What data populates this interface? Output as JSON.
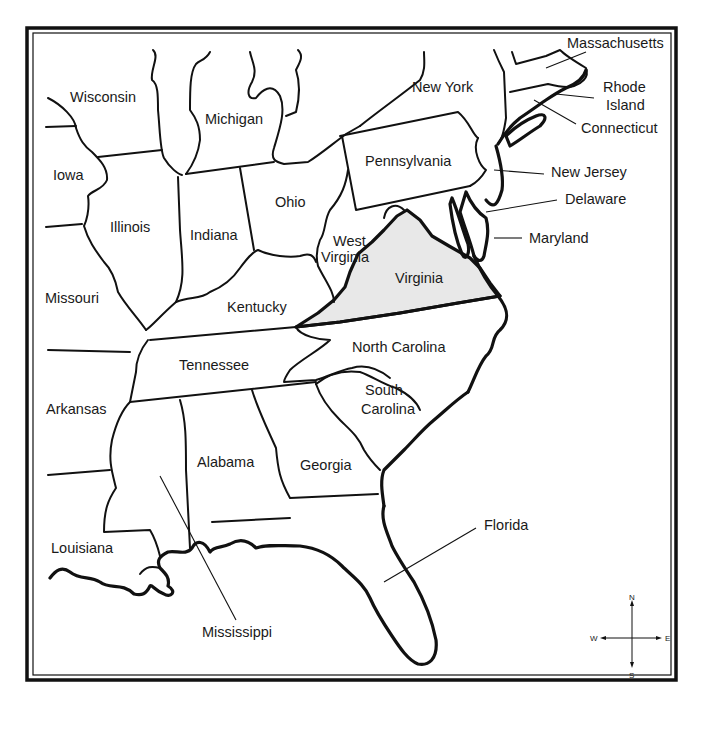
{
  "map": {
    "title": "",
    "highlighted_state": "Virginia",
    "highlight_color": "#e8e8e8",
    "states": [
      {
        "name": "Wisconsin",
        "x": 70,
        "y": 102
      },
      {
        "name": "Michigan",
        "x": 205,
        "y": 124
      },
      {
        "name": "New York",
        "x": 412,
        "y": 92
      },
      {
        "name": "Massachusetts",
        "x": 567,
        "y": 48
      },
      {
        "name": "Rhode",
        "x": 603,
        "y": 92
      },
      {
        "name": "Island",
        "x": 606,
        "y": 110
      },
      {
        "name": "Connecticut",
        "x": 581,
        "y": 133
      },
      {
        "name": "Pennsylvania",
        "x": 365,
        "y": 166
      },
      {
        "name": "New Jersey",
        "x": 551,
        "y": 177
      },
      {
        "name": "Delaware",
        "x": 565,
        "y": 204
      },
      {
        "name": "Maryland",
        "x": 529,
        "y": 243
      },
      {
        "name": "Iowa",
        "x": 53,
        "y": 180
      },
      {
        "name": "Illinois",
        "x": 110,
        "y": 232
      },
      {
        "name": "Indiana",
        "x": 190,
        "y": 240
      },
      {
        "name": "Ohio",
        "x": 275,
        "y": 207
      },
      {
        "name": "West",
        "x": 333,
        "y": 246
      },
      {
        "name": "Virginia",
        "x": 321,
        "y": 262
      },
      {
        "name": "Virginia",
        "x": 395,
        "y": 283
      },
      {
        "name": "Missouri",
        "x": 45,
        "y": 303
      },
      {
        "name": "Kentucky",
        "x": 227,
        "y": 312
      },
      {
        "name": "North Carolina",
        "x": 352,
        "y": 352
      },
      {
        "name": "Tennessee",
        "x": 179,
        "y": 370
      },
      {
        "name": "South",
        "x": 365,
        "y": 395
      },
      {
        "name": "Carolina",
        "x": 361,
        "y": 414
      },
      {
        "name": "Arkansas",
        "x": 46,
        "y": 414
      },
      {
        "name": "Alabama",
        "x": 197,
        "y": 467
      },
      {
        "name": "Georgia",
        "x": 300,
        "y": 470
      },
      {
        "name": "Florida",
        "x": 484,
        "y": 530
      },
      {
        "name": "Louisiana",
        "x": 51,
        "y": 553
      },
      {
        "name": "Mississippi",
        "x": 202,
        "y": 637
      }
    ],
    "compass": {
      "n": "N",
      "s": "S",
      "e": "E",
      "w": "W"
    }
  }
}
